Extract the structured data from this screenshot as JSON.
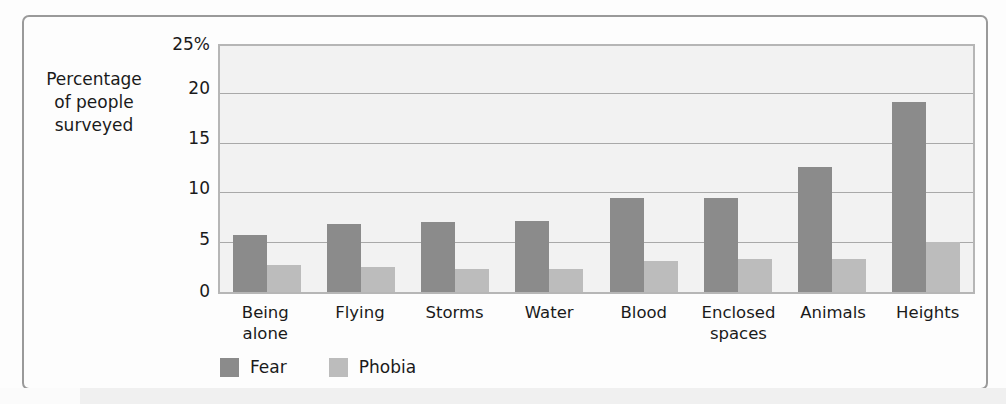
{
  "chart_data": {
    "type": "bar",
    "title": "",
    "subtitle": "",
    "xlabel": "",
    "ylabel": "Percentage of people surveyed",
    "ylabel_lines": [
      "Percentage",
      "of people",
      "surveyed"
    ],
    "ylim": [
      0,
      25
    ],
    "yticks": [
      0,
      5,
      10,
      15,
      20,
      25
    ],
    "ytick_labels": [
      "0",
      "5",
      "10",
      "15",
      "20",
      "25%"
    ],
    "grid": true,
    "legend_position": "bottom-left",
    "categories": [
      "Being alone",
      "Flying",
      "Storms",
      "Water",
      "Blood",
      "Enclosed spaces",
      "Animals",
      "Heights"
    ],
    "category_lines": [
      [
        "Being",
        "alone"
      ],
      [
        "Flying"
      ],
      [
        "Storms"
      ],
      [
        "Water"
      ],
      [
        "Blood"
      ],
      [
        "Enclosed",
        "spaces"
      ],
      [
        "Animals"
      ],
      [
        "Heights"
      ]
    ],
    "series": [
      {
        "name": "Fear",
        "color": "#8b8b8b",
        "values": [
          5.8,
          6.9,
          7.1,
          7.2,
          9.6,
          9.6,
          12.7,
          19.3
        ]
      },
      {
        "name": "Phobia",
        "color": "#bcbcbc",
        "values": [
          2.7,
          2.5,
          2.3,
          2.3,
          3.2,
          3.4,
          3.4,
          5.1
        ]
      }
    ]
  },
  "legend": {
    "items": [
      {
        "label": "Fear",
        "color": "#8b8b8b"
      },
      {
        "label": "Phobia",
        "color": "#bcbcbc"
      }
    ]
  },
  "colors": {
    "fear": "#8b8b8b",
    "phobia": "#bcbcbc",
    "plot_background": "#f2f2f2",
    "gridline": "#a9a9a9",
    "frame_border": "#9a9a9a",
    "text": "#1a1a1a"
  }
}
